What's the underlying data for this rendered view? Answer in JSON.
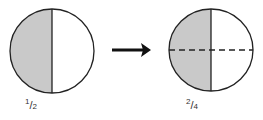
{
  "diagram": {
    "left": {
      "fraction": {
        "numerator": "1",
        "denominator": "2"
      },
      "shaded_parts": 1,
      "total_parts": 2
    },
    "arrow": {
      "direction": "right"
    },
    "right": {
      "fraction": {
        "numerator": "2",
        "denominator": "4"
      },
      "shaded_parts": 2,
      "total_parts": 4
    },
    "colors": {
      "shade": "#c9c9c9",
      "stroke": "#222222",
      "background": "#ffffff"
    }
  }
}
